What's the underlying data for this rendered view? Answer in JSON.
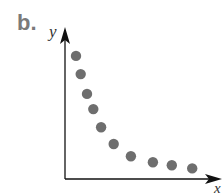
{
  "panel_label": "b.",
  "chart_data": {
    "type": "scatter",
    "title": "",
    "xlabel": "x",
    "ylabel": "y",
    "grid": false,
    "ticks": false,
    "points": [
      {
        "x": 0.07,
        "y": 0.81
      },
      {
        "x": 0.1,
        "y": 0.69
      },
      {
        "x": 0.14,
        "y": 0.56
      },
      {
        "x": 0.18,
        "y": 0.46
      },
      {
        "x": 0.23,
        "y": 0.34
      },
      {
        "x": 0.31,
        "y": 0.23
      },
      {
        "x": 0.42,
        "y": 0.15
      },
      {
        "x": 0.56,
        "y": 0.11
      },
      {
        "x": 0.68,
        "y": 0.09
      },
      {
        "x": 0.81,
        "y": 0.07
      }
    ],
    "marker_color": "#6e6e6e",
    "axis_color": "#111111"
  }
}
